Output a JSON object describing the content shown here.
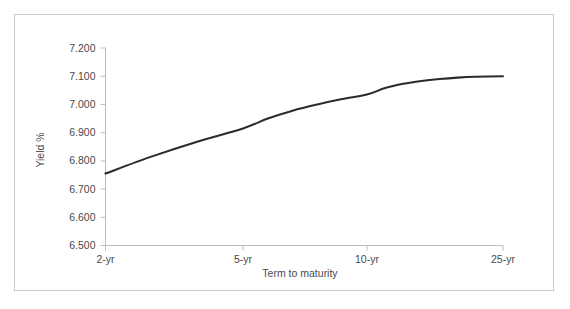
{
  "figure": {
    "border_color": "#c9c9c9",
    "background": "#ffffff"
  },
  "chart_data": {
    "type": "line",
    "title": "",
    "subtitle": "",
    "xlabel": "Term to maturity",
    "ylabel": "Yield %",
    "grid": false,
    "legend": "none",
    "line_color": "#2b2b2b",
    "axis_color": "#bdbdbd",
    "x": [
      "2-yr",
      "5-yr",
      "10-yr",
      "25-yr"
    ],
    "x_positions": [
      2,
      5,
      10,
      25
    ],
    "xticklabels": [
      "2-yr",
      "5-yr",
      "10-yr",
      "25-yr"
    ],
    "yticklabels": [
      "7.200",
      "7.100",
      "7.000",
      "6.900",
      "6.800",
      "6.700",
      "6.600",
      "6.500"
    ],
    "ytickvalues": [
      7.2,
      7.1,
      7.0,
      6.9,
      6.8,
      6.7,
      6.6,
      6.5
    ],
    "ylim": [
      6.5,
      7.2
    ],
    "xlim": [
      2,
      25
    ],
    "series": [
      {
        "name": "Yield curve",
        "values": [
          6.755,
          6.915,
          7.035,
          7.1
        ],
        "dense_x": [
          2,
          3,
          4,
          5,
          6,
          7,
          8,
          9,
          10,
          12,
          14,
          16,
          18,
          20,
          22,
          25
        ],
        "dense_values": [
          6.755,
          6.815,
          6.868,
          6.915,
          6.95,
          6.978,
          7.0,
          7.019,
          7.035,
          7.058,
          7.073,
          7.083,
          7.09,
          7.095,
          7.098,
          7.1
        ]
      }
    ]
  }
}
